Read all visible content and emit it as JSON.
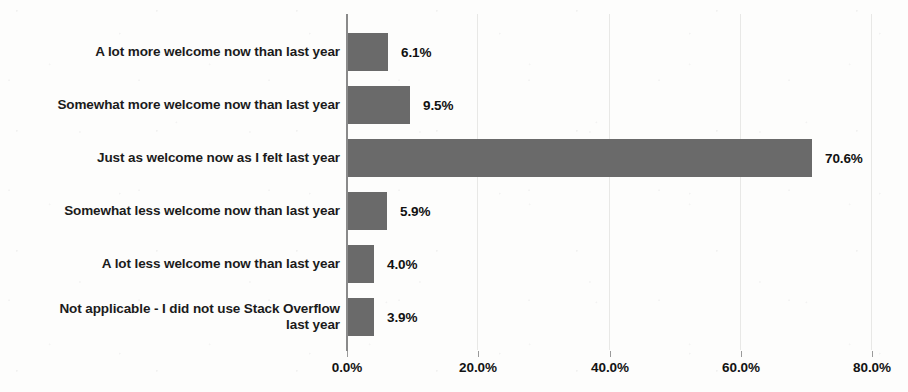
{
  "chart_data": {
    "type": "bar",
    "orientation": "horizontal",
    "title": "",
    "subtitle": "",
    "xlabel": "",
    "ylabel": "",
    "xlim": [
      0,
      80
    ],
    "grid": true,
    "legend": null,
    "categories": [
      "A lot more welcome now than last year",
      "Somewhat more welcome now than last year",
      "Just as welcome now as I felt last year",
      "Somewhat less welcome now than last year",
      "A lot less welcome now than last year",
      "Not applicable - I did not use Stack Overflow last year"
    ],
    "category_lines": [
      [
        "A lot more welcome now than last year"
      ],
      [
        "Somewhat more welcome now than last year"
      ],
      [
        "Just as welcome now as I felt last year"
      ],
      [
        "Somewhat less welcome now than last year"
      ],
      [
        "A lot less welcome now than last year"
      ],
      [
        "Not applicable - I did not use Stack Overflow",
        "last year"
      ]
    ],
    "values": [
      6.1,
      9.5,
      70.6,
      5.9,
      4.0,
      3.9
    ],
    "value_labels": [
      "6.1%",
      "9.5%",
      "70.6%",
      "5.9%",
      "4.0%",
      "3.9%"
    ],
    "xticks": [
      0,
      20,
      40,
      60,
      80
    ],
    "xtick_labels": [
      "0.0%",
      "20.0%",
      "40.0%",
      "60.0%",
      "80.0%"
    ],
    "bar_color": "#6a6a6a",
    "text_color": "#1b1b1b",
    "axis_color": "#8a8a8a",
    "gridline_color": "#e8e8e6",
    "background_color": "#fdfdfc"
  }
}
